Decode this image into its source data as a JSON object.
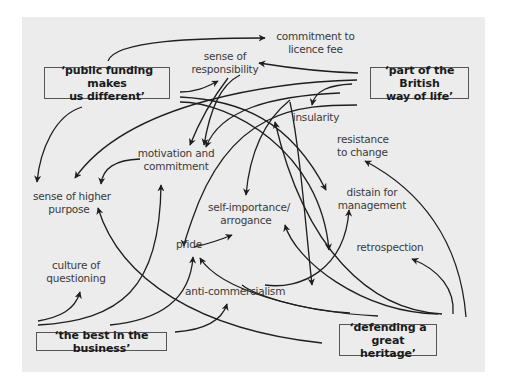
{
  "diagram": {
    "type": "influence-map",
    "colors": {
      "panel_bg": "#ececec",
      "line": "#1e1e1e",
      "text": "#3a3a3a",
      "box_border": "#555555"
    },
    "boxes": [
      {
        "id": "public_funding",
        "line1": "‘public funding makes",
        "line2": "us different’"
      },
      {
        "id": "british_way",
        "line1": "‘part of the British",
        "line2": "way of life’"
      },
      {
        "id": "best_business",
        "line1": "‘the best in the business’",
        "line2": ""
      },
      {
        "id": "great_heritage",
        "line1": "‘defending a great",
        "line2": "heritage’"
      }
    ],
    "nodes": [
      {
        "id": "licence_fee",
        "line1": "commitment to",
        "line2": "licence fee"
      },
      {
        "id": "responsibility",
        "line1": "sense of",
        "line2": "responsibility"
      },
      {
        "id": "insularity",
        "line1": "insularity",
        "line2": ""
      },
      {
        "id": "resistance",
        "line1": "resistance",
        "line2": "to change"
      },
      {
        "id": "motivation",
        "line1": "motivation and",
        "line2": "commitment"
      },
      {
        "id": "higher_purpose",
        "line1": "sense of higher",
        "line2": "purpose"
      },
      {
        "id": "distain",
        "line1": "distain for",
        "line2": "management"
      },
      {
        "id": "self_importance",
        "line1": "self-importance/",
        "line2": "arrogance"
      },
      {
        "id": "pride",
        "line1": "pride",
        "line2": ""
      },
      {
        "id": "retrospection",
        "line1": "retrospection",
        "line2": ""
      },
      {
        "id": "culture_questioning",
        "line1": "culture of",
        "line2": "questioning"
      },
      {
        "id": "anti_commercialism",
        "line1": "anti-commercialism",
        "line2": ""
      }
    ],
    "edges": [
      {
        "from": "public_funding",
        "to": "licence_fee"
      },
      {
        "from": "public_funding",
        "to": "responsibility"
      },
      {
        "from": "public_funding",
        "to": "higher_purpose"
      },
      {
        "from": "public_funding",
        "to": "motivation"
      },
      {
        "from": "public_funding",
        "to": "distain"
      },
      {
        "from": "british_way",
        "to": "responsibility"
      },
      {
        "from": "british_way",
        "to": "insularity"
      },
      {
        "from": "british_way",
        "to": "higher_purpose"
      },
      {
        "from": "british_way",
        "to": "motivation"
      },
      {
        "from": "british_way",
        "to": "pride"
      },
      {
        "from": "british_way",
        "to": "self_importance"
      },
      {
        "from": "motivation",
        "to": "higher_purpose"
      },
      {
        "from": "pride",
        "to": "self_importance"
      },
      {
        "from": "best_business",
        "to": "culture_questioning"
      },
      {
        "from": "best_business",
        "to": "motivation"
      },
      {
        "from": "best_business",
        "to": "pride"
      },
      {
        "from": "best_business",
        "to": "anti_commercialism"
      },
      {
        "from": "anti_commercialism",
        "to": "distain"
      },
      {
        "from": "great_heritage",
        "to": "resistance"
      },
      {
        "from": "great_heritage",
        "to": "retrospection"
      },
      {
        "from": "great_heritage",
        "to": "higher_purpose"
      },
      {
        "from": "great_heritage",
        "to": "pride"
      },
      {
        "from": "great_heritage",
        "to": "self_importance"
      },
      {
        "from": "great_heritage",
        "to": "insularity"
      },
      {
        "from": "great_heritage",
        "to": "anti_commercialism"
      }
    ]
  }
}
